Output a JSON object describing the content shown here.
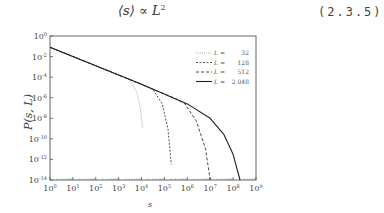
{
  "equation": {
    "lhs": "⟨s⟩ ∝ L",
    "exponent": "2",
    "number": "(2.3.5)"
  },
  "chart_data": {
    "type": "line",
    "title": "",
    "xlabel": "s",
    "ylabel": "P(s, L)",
    "xscale": "log",
    "yscale": "log",
    "xlim": [
      1,
      1000000000
    ],
    "ylim": [
      1e-14,
      1
    ],
    "x_ticks": [
      "10^0",
      "10^1",
      "10^2",
      "10^3",
      "10^4",
      "10^5",
      "10^6",
      "10^7",
      "10^8",
      "10^9"
    ],
    "y_ticks": [
      "10^0",
      "10^-2",
      "10^-4",
      "10^-6",
      "10^-8",
      "10^-10",
      "10^-12",
      "10^-14"
    ],
    "legend_position": "upper right",
    "series": [
      {
        "name": "L = 32",
        "style": "dotted",
        "color": "#aaaaaa",
        "points_log10": [
          [
            0,
            -1.1
          ],
          [
            1,
            -2.0
          ],
          [
            2,
            -2.9
          ],
          [
            3,
            -3.8
          ],
          [
            3.5,
            -4.3
          ],
          [
            3.8,
            -5.5
          ],
          [
            3.95,
            -7.0
          ],
          [
            4.05,
            -9.0
          ]
        ]
      },
      {
        "name": "L = 128",
        "style": "short-dashed",
        "color": "#444444",
        "points_log10": [
          [
            0,
            -1.1
          ],
          [
            2,
            -2.9
          ],
          [
            4,
            -4.7
          ],
          [
            4.5,
            -5.2
          ],
          [
            4.9,
            -6.6
          ],
          [
            5.15,
            -9.0
          ],
          [
            5.3,
            -12.5
          ]
        ]
      },
      {
        "name": "L = 512",
        "style": "dashed",
        "color": "#333333",
        "points_log10": [
          [
            0,
            -1.1
          ],
          [
            3,
            -3.8
          ],
          [
            5.5,
            -6.1
          ],
          [
            5.9,
            -6.6
          ],
          [
            6.4,
            -8.3
          ],
          [
            6.8,
            -11.0
          ],
          [
            7.0,
            -14.0
          ]
        ]
      },
      {
        "name": "L = 2048",
        "style": "solid",
        "color": "#222222",
        "points_log10": [
          [
            0,
            -1.1
          ],
          [
            4,
            -4.7
          ],
          [
            6,
            -6.6
          ],
          [
            7,
            -8.0
          ],
          [
            7.6,
            -9.6
          ],
          [
            8.0,
            -11.5
          ],
          [
            8.3,
            -14.0
          ]
        ]
      }
    ],
    "legend": [
      {
        "label": "L =",
        "value": "32"
      },
      {
        "label": "L =",
        "value": "128"
      },
      {
        "label": "L =",
        "value": "512"
      },
      {
        "label": "L =",
        "value": "2 048"
      }
    ]
  }
}
